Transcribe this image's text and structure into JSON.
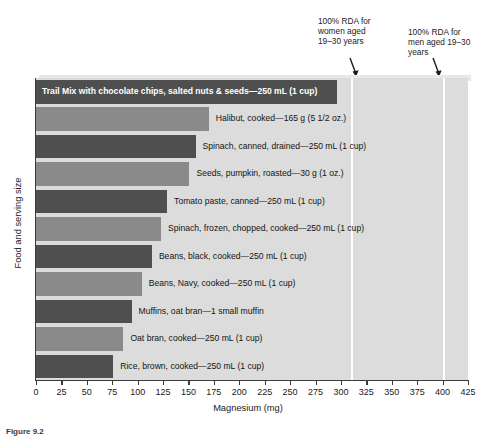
{
  "chart_data": {
    "type": "bar",
    "orientation": "horizontal",
    "title": "",
    "xlabel": "Magnesium (mg)",
    "ylabel": "Food and serving size",
    "xlim": [
      0,
      425
    ],
    "xticks": [
      0,
      25,
      50,
      75,
      100,
      125,
      150,
      175,
      200,
      225,
      250,
      275,
      300,
      325,
      350,
      375,
      400,
      425
    ],
    "grid": false,
    "legend": "none",
    "categories": [
      "Trail Mix with chocolate chips, salted nuts & seeds—250 mL (1 cup)",
      "Halibut, cooked—165 g (5 1/2 oz.)",
      "Spinach, canned, drained—250 mL (1 cup)",
      "Seeds, pumpkin, roasted—30 g (1 oz.)",
      "Tomato paste, canned—250 mL (1 cup)",
      "Spinach, frozen, chopped, cooked—250 mL (1 cup)",
      "Beans, black, cooked—250 mL (1 cup)",
      "Beans, Navy, cooked—250 mL (1 cup)",
      "Muffins, oat bran—1 small muffin",
      "Oat bran, cooked—250 mL (1 cup)",
      "Rice, brown, cooked—250 mL (1 cup)"
    ],
    "values": [
      296,
      170,
      157,
      151,
      129,
      123,
      114,
      104,
      94,
      86,
      76
    ],
    "annotations": [
      {
        "label": "100% RDA for women aged 19–30 years",
        "value": 310
      },
      {
        "label": "100% RDA for men aged 19–30 years",
        "value": 400
      }
    ]
  },
  "annotations": {
    "women": "100% RDA for women aged 19–30 years",
    "men": "100% RDA for men aged 19–30 years"
  },
  "axes": {
    "xlabel": "Magnesium (mg)",
    "ylabel": "Food and serving size"
  },
  "caption": "Figure 9.2",
  "colors": {
    "bar_dark": "#4f4f4f",
    "bar_light": "#8a8a8a",
    "plot_background": "#dcdcdc",
    "rda_line": "#ffffff",
    "axis": "#3a3a3a"
  }
}
